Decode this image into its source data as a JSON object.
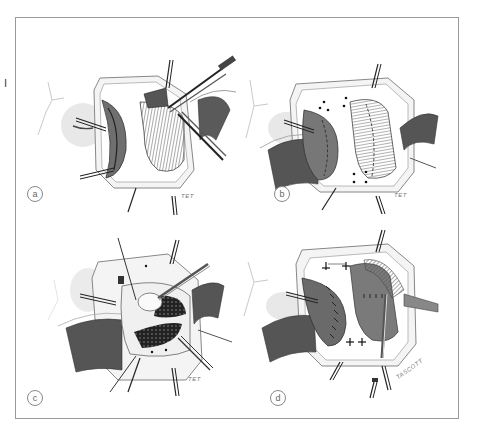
{
  "figure": {
    "plate_marker": "I",
    "panels": [
      {
        "id": "a",
        "label": "a",
        "signature": "TET"
      },
      {
        "id": "b",
        "label": "b",
        "signature": "TET"
      },
      {
        "id": "c",
        "label": "c",
        "signature": "TET"
      },
      {
        "id": "d",
        "label": "d",
        "signature": "TASCOTT"
      }
    ]
  },
  "colors": {
    "frame": "#9a9a9a",
    "ink": "#333333",
    "shade_dark": "#3a3a3a",
    "shade_mid": "#7a7a7a",
    "shade_light": "#c8c8c8",
    "background": "#ffffff"
  }
}
